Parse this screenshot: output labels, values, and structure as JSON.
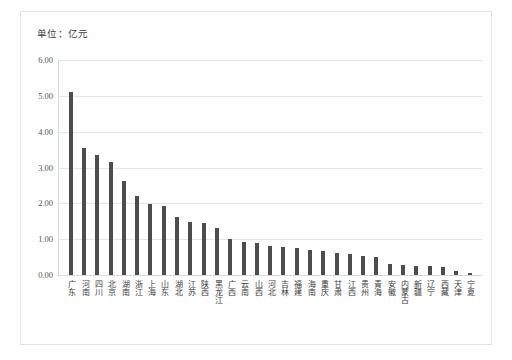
{
  "chart_data": {
    "type": "bar",
    "title": "单位：亿元",
    "xlabel": "",
    "ylabel": "",
    "ylim": [
      0.0,
      6.0
    ],
    "ytick_labels": [
      "6.00",
      "5.00",
      "4.00",
      "3.00",
      "2.00",
      "1.00",
      "0.00"
    ],
    "ytick_values": [
      6.0,
      5.0,
      4.0,
      3.0,
      2.0,
      1.0,
      0.0
    ],
    "grid": true,
    "legend": null,
    "bar_color": "#4d4d4d",
    "categories": [
      "广东",
      "河南",
      "四川",
      "北京",
      "湖南",
      "浙江",
      "上海",
      "山东",
      "湖北",
      "江苏",
      "陕西",
      "黑龙江",
      "广西",
      "云南",
      "山西",
      "河北",
      "吉林",
      "福建",
      "海南",
      "重庆",
      "甘肃",
      "江西",
      "贵州",
      "青海",
      "安徽",
      "内蒙古",
      "新疆",
      "辽宁",
      "西藏",
      "天津",
      "宁夏"
    ],
    "values": [
      5.1,
      3.55,
      3.35,
      3.15,
      2.62,
      2.2,
      1.98,
      1.92,
      1.62,
      1.48,
      1.45,
      1.32,
      1.0,
      0.92,
      0.88,
      0.82,
      0.78,
      0.74,
      0.7,
      0.66,
      0.62,
      0.58,
      0.54,
      0.5,
      0.3,
      0.28,
      0.26,
      0.25,
      0.22,
      0.12,
      0.06
    ]
  }
}
